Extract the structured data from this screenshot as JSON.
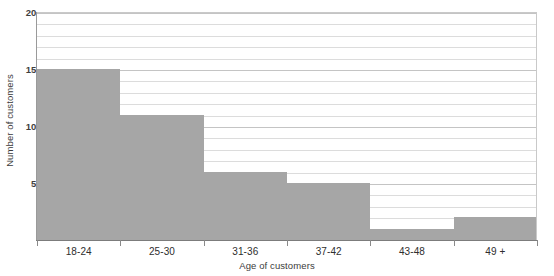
{
  "chart_data": {
    "type": "bar",
    "title": "",
    "subtitle": "",
    "xlabel": "Age of customers",
    "ylabel": "Number of customers",
    "categories": [
      "18-24",
      "25-30",
      "31-36",
      "37-42",
      "43-48",
      "49 +"
    ],
    "values": [
      15,
      11,
      6,
      5,
      1,
      2
    ],
    "series": [
      {
        "name": "Number of customers",
        "values": [
          15,
          11,
          6,
          5,
          1,
          2
        ]
      }
    ],
    "ylim": [
      0,
      20
    ],
    "xlim_bins": 6,
    "y_tick_labels": [
      "5",
      "10",
      "15",
      "20"
    ],
    "y_tick_values": [
      5,
      10,
      15,
      20
    ],
    "y_gridline_step": 1,
    "y_major_step": 5,
    "grid": true,
    "grid_axis": "y",
    "legend": false,
    "legend_position": "none",
    "bar_gap": 0,
    "style": "histogram",
    "colors": {
      "bar_fill": "#a6a6a6",
      "gridline_minor": "#dcdcdc",
      "gridline_major": "#c4c4c4",
      "axis_line": "#7c7c7c",
      "tick_label": "#2e2e2e",
      "axis_title": "#3b3b3b",
      "plot_background": "#ffffff"
    },
    "annotations": []
  }
}
